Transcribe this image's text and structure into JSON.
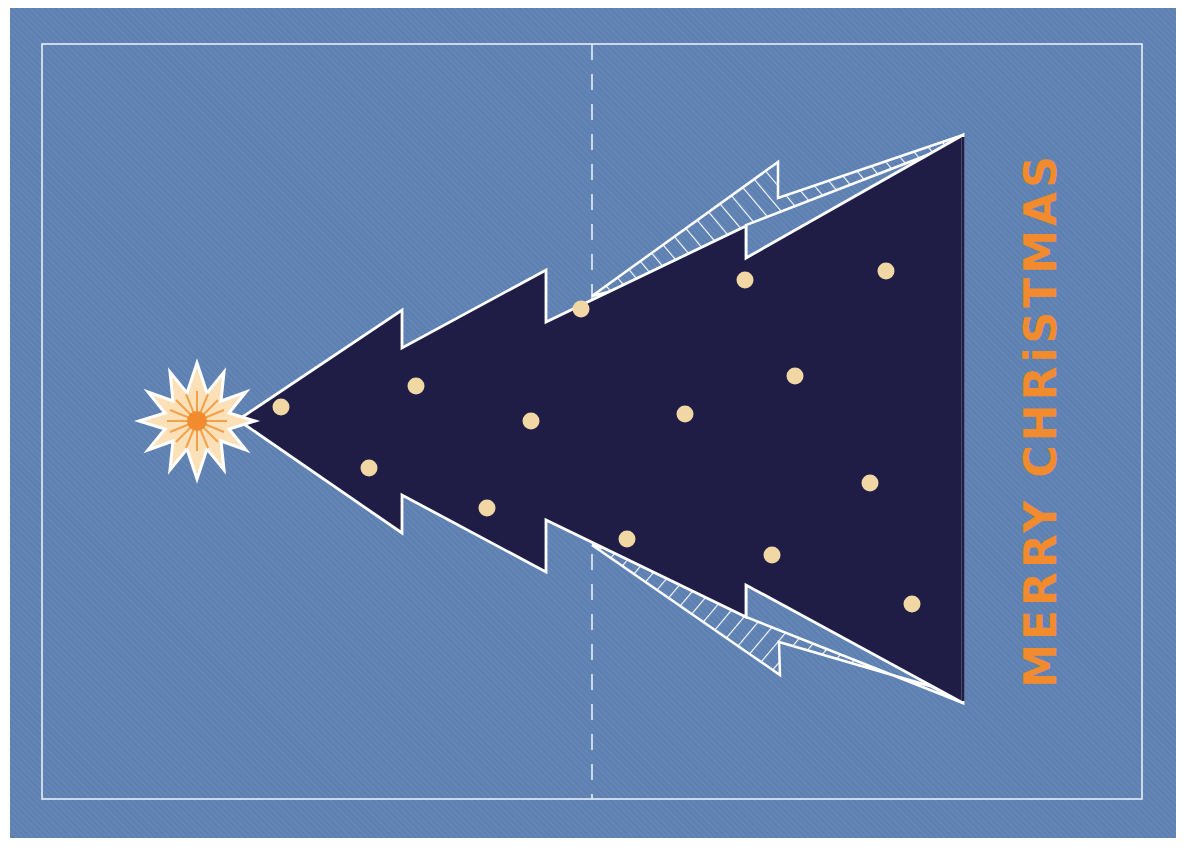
{
  "card": {
    "greeting": "MERRY CHRiSTMAS",
    "colors": {
      "background": "#5f83b5",
      "tree": "#1f1d45",
      "outline": "#ffffff",
      "ornament": "#f1d7a4",
      "star_outer": "#fbe0b8",
      "star_center": "#f28a2e",
      "text": "#f28a2e"
    },
    "icons": [
      "star-icon",
      "christmas-tree-icon",
      "ornament-icon"
    ],
    "ornament_count": 16
  }
}
